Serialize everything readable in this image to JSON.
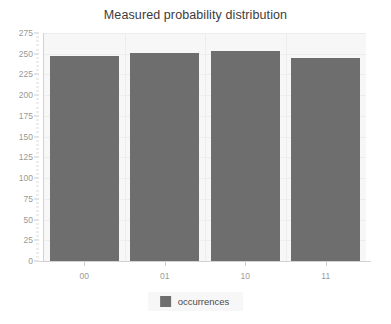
{
  "chart_data": {
    "type": "bar",
    "title": "Measured probability distribution",
    "xlabel": "",
    "ylabel": "",
    "categories": [
      "00",
      "01",
      "10",
      "11"
    ],
    "series": [
      {
        "name": "occurrences",
        "values": [
          247,
          251,
          253,
          245
        ],
        "color": "#6e6e6e"
      }
    ],
    "ylim": [
      0,
      275
    ],
    "ytick_step": 25,
    "yticks": [
      0,
      25,
      50,
      75,
      100,
      125,
      150,
      175,
      200,
      225,
      250,
      275
    ],
    "ytick_labels": [
      "0",
      "25",
      "50",
      "75",
      "100",
      "125",
      "150",
      "175",
      "200",
      "225",
      "250",
      "275"
    ],
    "grid": true,
    "legend": {
      "position": "bottom",
      "entries": [
        {
          "label": "occurrences",
          "color": "#6e6e6e"
        }
      ]
    },
    "colors": {
      "bar": "#6e6e6e",
      "plot_background": "#f7f7f7",
      "page_background": "#ffffff",
      "gridline": "#ededed",
      "axis_line": "#d2d2d2",
      "tick_label": "#9a9a9a",
      "title_text": "#3c3c3c",
      "legend_text": "#4a4a4a",
      "legend_background": "#f7f7f7"
    }
  }
}
